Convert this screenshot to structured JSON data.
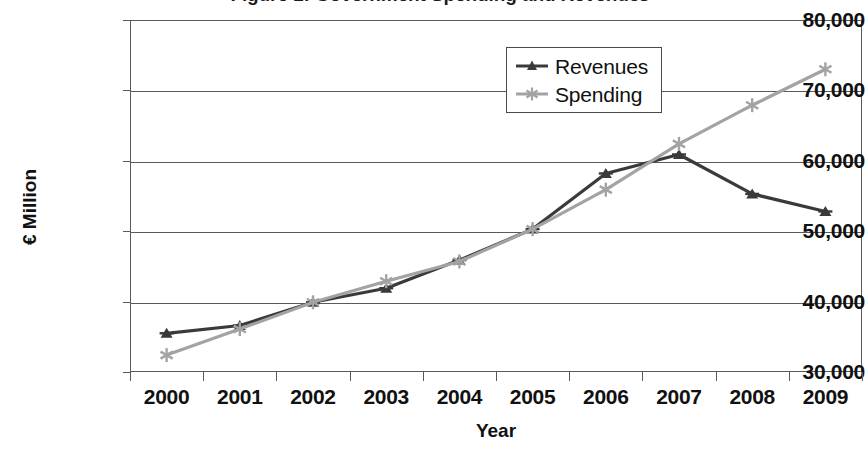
{
  "chart_data": {
    "type": "line",
    "title": "Figure 1: Government Spending and Revenues",
    "xlabel": "Year",
    "ylabel": "€ Million",
    "categories": [
      "2000",
      "2001",
      "2002",
      "2003",
      "2004",
      "2005",
      "2006",
      "2007",
      "2008",
      "2009"
    ],
    "series": [
      {
        "name": "Revenues",
        "color": "#3a3a3a",
        "marker": "triangle",
        "values": [
          35500,
          36600,
          39900,
          41900,
          45900,
          50300,
          58200,
          60900,
          55300,
          52800
        ]
      },
      {
        "name": "Spending",
        "color": "#a3a3a3",
        "marker": "star",
        "values": [
          32400,
          36100,
          39900,
          42900,
          45700,
          50300,
          55900,
          62400,
          67900,
          73000
        ]
      }
    ],
    "ylim": [
      30000,
      80000
    ],
    "ytick_values": [
      80000,
      70000,
      60000,
      50000,
      40000,
      30000
    ],
    "ytick_labels": [
      "80,000",
      "70,000",
      "60,000",
      "50,000",
      "40,000",
      "30,000"
    ],
    "grid": true,
    "legend_position": "top-center-inside"
  },
  "legend": {
    "entries": [
      {
        "label": "Revenues"
      },
      {
        "label": "Spending"
      }
    ]
  }
}
